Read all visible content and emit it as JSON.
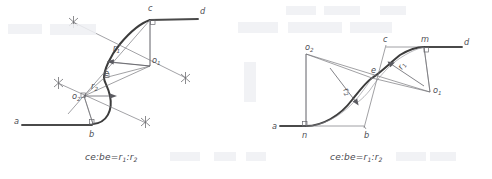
{
  "figure": {
    "background_color": "#ffffff",
    "ink_color": "#4a4a4a",
    "caption_text_left": "ce:be=r",
    "caption_text_right": "ce:be=r"
  },
  "diagrams": [
    {
      "id": "left-diagram",
      "name": "s-curve-tangent-construction-left",
      "caption": {
        "prefix": "ce:be=r",
        "sub1": "1",
        "mid": ":r",
        "sub2": "2",
        "full": "ce:be=r1:r2"
      },
      "labels": [
        {
          "name": "point-a",
          "text": "a",
          "sub": "",
          "x": 14,
          "y": 124
        },
        {
          "name": "point-b",
          "text": "b",
          "sub": "",
          "x": 89,
          "y": 137
        },
        {
          "name": "point-c",
          "text": "c",
          "sub": "",
          "x": 148,
          "y": 11
        },
        {
          "name": "point-d",
          "text": "d",
          "sub": "",
          "x": 200,
          "y": 14
        },
        {
          "name": "point-e",
          "text": "e",
          "sub": "",
          "x": 104,
          "y": 76
        },
        {
          "name": "center-o1",
          "text": "o",
          "sub": "1",
          "x": 152,
          "y": 63
        },
        {
          "name": "center-o2",
          "text": "o",
          "sub": "2",
          "x": 74,
          "y": 98
        },
        {
          "name": "radius-r1",
          "text": "r",
          "sub": "1",
          "x": 113,
          "y": 50
        },
        {
          "name": "radius-r2",
          "text": "r",
          "sub": "2",
          "x": 92,
          "y": 88
        }
      ]
    },
    {
      "id": "right-diagram",
      "name": "s-curve-tangent-construction-right",
      "caption": {
        "prefix": "ce:be=r",
        "sub1": "1",
        "mid": ":r",
        "sub2": "2",
        "full": "ce:be=r1:r2"
      },
      "labels": [
        {
          "name": "point-a",
          "text": "a",
          "sub": "",
          "x": 273,
          "y": 130
        },
        {
          "name": "point-n",
          "text": "n",
          "sub": "",
          "x": 304,
          "y": 139
        },
        {
          "name": "point-b",
          "text": "b",
          "sub": "",
          "x": 365,
          "y": 139
        },
        {
          "name": "point-c",
          "text": "c",
          "sub": "",
          "x": 385,
          "y": 40
        },
        {
          "name": "point-m",
          "text": "m",
          "sub": "",
          "x": 425,
          "y": 39
        },
        {
          "name": "point-d",
          "text": "d",
          "sub": "",
          "x": 464,
          "y": 43
        },
        {
          "name": "point-e",
          "text": "e",
          "sub": "",
          "x": 372,
          "y": 72
        },
        {
          "name": "center-o1",
          "text": "o",
          "sub": "1",
          "x": 437,
          "y": 89
        },
        {
          "name": "center-o2",
          "text": "o",
          "sub": "2",
          "x": 308,
          "y": 50
        },
        {
          "name": "radius-r1",
          "text": "r",
          "sub": "1",
          "x": 404,
          "y": 68
        },
        {
          "name": "radius-r2",
          "text": "r",
          "sub": "2",
          "x": 348,
          "y": 90
        }
      ]
    }
  ]
}
